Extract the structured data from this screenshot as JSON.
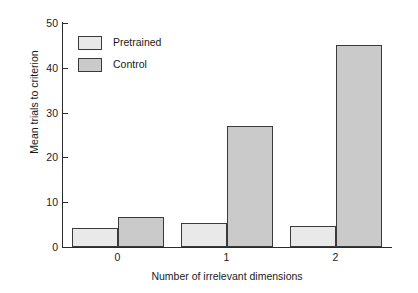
{
  "chart_data": {
    "type": "bar",
    "title": "",
    "subtitle": "",
    "xlabel": "Number of irrelevant dimensions",
    "ylabel": "Mean trials to criterion",
    "categories": [
      "0",
      "1",
      "2"
    ],
    "series": [
      {
        "name": "Pretrained",
        "values": [
          4.2,
          5.4,
          4.7
        ],
        "color": "#e9e9e9"
      },
      {
        "name": "Control",
        "values": [
          6.7,
          27.0,
          45.0
        ],
        "color": "#cacaca"
      }
    ],
    "ylim": [
      0,
      50
    ],
    "yticks": [
      0,
      10,
      20,
      30,
      40,
      50
    ],
    "ytick_labels": [
      "0",
      "10",
      "20",
      "30",
      "40",
      "50"
    ],
    "xtick_labels": [
      "0",
      "1",
      "2"
    ],
    "grid": false,
    "legend_position": "top-left",
    "bar_edge_color": "#3a3a3a",
    "axis_color": "#2b2b2b"
  },
  "legend": {
    "entries": [
      {
        "label": "Pretrained"
      },
      {
        "label": "Control"
      }
    ]
  }
}
